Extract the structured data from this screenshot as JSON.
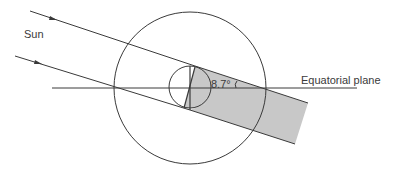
{
  "figure": {
    "labels": {
      "sun": "Sun",
      "equatorial_plane": "Equatorial plane",
      "angle": "8.7°"
    },
    "colors": {
      "line": "#3a3a3a",
      "shadow_fill": "#c8c8c8",
      "background": "#ffffff"
    },
    "elements": {
      "outer_circle": {
        "cx": 190,
        "cy": 88,
        "r": 76
      },
      "inner_circle": {
        "cx": 190,
        "cy": 87,
        "r": 21
      },
      "tilt_angle_deg": 8.7
    }
  }
}
